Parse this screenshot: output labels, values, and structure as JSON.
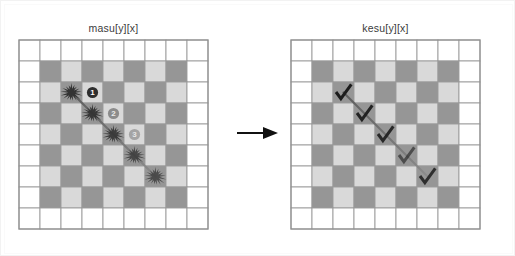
{
  "figure": {
    "background_color": "#ffffff",
    "grid_line_color": "#9a9a9a",
    "cell_dark_color": "#969696",
    "cell_light_color": "#d9d9d9",
    "cell_empty_color": "#ffffff",
    "marker_color": "#333333",
    "badge_fill": "#2e2e2e",
    "badge_text_color": "#ffffff",
    "path_color": "#5a5a5a",
    "arrow_color": "#111111",
    "cell_size": 21,
    "grid_cols": 9,
    "grid_rows": 9
  },
  "panels": [
    {
      "id": "masu",
      "title": "masu[y][x]",
      "left": 0,
      "grid_left": 17,
      "marker_type": "burr",
      "markers": [
        {
          "col": 2,
          "row": 2,
          "opacity": 1.0
        },
        {
          "col": 3,
          "row": 3,
          "opacity": 0.95
        },
        {
          "col": 4,
          "row": 4,
          "opacity": 0.9
        },
        {
          "col": 5,
          "row": 5,
          "opacity": 0.8
        },
        {
          "col": 6,
          "row": 6,
          "opacity": 0.75
        }
      ],
      "badges": [
        {
          "label": "1",
          "col": 3,
          "row": 2,
          "opacity": 1.0
        },
        {
          "label": "2",
          "col": 4,
          "row": 3,
          "opacity": 0.45
        },
        {
          "label": "3",
          "col": 5,
          "row": 4,
          "opacity": 0.3
        }
      ],
      "path": {
        "from_col": 2,
        "from_row": 2,
        "to_col": 6,
        "to_row": 6
      }
    },
    {
      "id": "kesu",
      "title": "kesu[y][x]",
      "left": 272,
      "grid_left": 289,
      "marker_type": "check",
      "markers": [
        {
          "col": 2,
          "row": 2,
          "opacity": 1.0
        },
        {
          "col": 3,
          "row": 3,
          "opacity": 0.95
        },
        {
          "col": 4,
          "row": 4,
          "opacity": 0.9
        },
        {
          "col": 5,
          "row": 5,
          "opacity": 0.6
        },
        {
          "col": 6,
          "row": 6,
          "opacity": 0.85
        }
      ],
      "badges": [],
      "path": {
        "from_col": 2,
        "from_row": 2,
        "to_col": 6,
        "to_row": 6
      }
    }
  ],
  "board_pattern": {
    "description": "9x9 grid; outer ring is empty white; inner 7x7 is a checkerboard of dark and light cells",
    "border_ring": "empty",
    "inner_origin": 1,
    "inner_size": 7,
    "dark_when": "(col+row) even"
  },
  "arrow": {
    "name": "right-arrow",
    "glyph": "→",
    "width": 42,
    "height": 16
  }
}
